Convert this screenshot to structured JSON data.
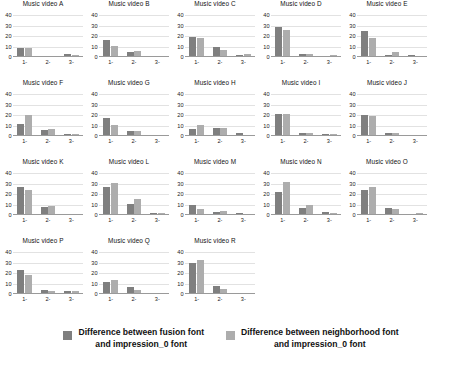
{
  "chart_data": {
    "type": "bar",
    "title": "",
    "xlabel": "",
    "ylabel": "",
    "ylim": [
      0,
      44
    ],
    "yticks": [
      0,
      10,
      20,
      30,
      40
    ],
    "ytick_labels": [
      "0",
      "10",
      "20",
      "30",
      "40"
    ],
    "categories": [
      "1-",
      "2-",
      "3-"
    ],
    "grid": true,
    "legend_position": "bottom",
    "series_names": [
      "Difference between fusion font and impression_0 font",
      "Difference between neighborhood font and impression_0 font"
    ],
    "colors": [
      "#7f7f7f",
      "#adadad"
    ],
    "panels": [
      {
        "title": "Music video A",
        "series": [
          {
            "name": "fusion",
            "values": [
              8,
              0,
              2
            ]
          },
          {
            "name": "neighborhood",
            "values": [
              8,
              0,
              1
            ]
          }
        ]
      },
      {
        "title": "Music video B",
        "series": [
          {
            "name": "fusion",
            "values": [
              15,
              4,
              0
            ]
          },
          {
            "name": "neighborhood",
            "values": [
              10,
              5,
              0
            ]
          }
        ]
      },
      {
        "title": "Music video C",
        "series": [
          {
            "name": "fusion",
            "values": [
              18,
              9,
              1
            ]
          },
          {
            "name": "neighborhood",
            "values": [
              17,
              6,
              2
            ]
          }
        ]
      },
      {
        "title": "Music video D",
        "series": [
          {
            "name": "fusion",
            "values": [
              28,
              2,
              0
            ]
          },
          {
            "name": "neighborhood",
            "values": [
              25,
              2,
              1
            ]
          }
        ]
      },
      {
        "title": "Music video E",
        "series": [
          {
            "name": "fusion",
            "values": [
              24,
              1,
              1
            ]
          },
          {
            "name": "neighborhood",
            "values": [
              17,
              4,
              0
            ]
          }
        ]
      },
      {
        "title": "Music video F",
        "series": [
          {
            "name": "fusion",
            "values": [
              11,
              5,
              1
            ]
          },
          {
            "name": "neighborhood",
            "values": [
              19,
              6,
              1
            ]
          }
        ]
      },
      {
        "title": "Music video G",
        "series": [
          {
            "name": "fusion",
            "values": [
              16,
              4,
              0
            ]
          },
          {
            "name": "neighborhood",
            "values": [
              10,
              4,
              0
            ]
          }
        ]
      },
      {
        "title": "Music video H",
        "series": [
          {
            "name": "fusion",
            "values": [
              6,
              7,
              2
            ]
          },
          {
            "name": "neighborhood",
            "values": [
              10,
              7,
              0
            ]
          }
        ]
      },
      {
        "title": "Music video I",
        "series": [
          {
            "name": "fusion",
            "values": [
              20,
              2,
              1
            ]
          },
          {
            "name": "neighborhood",
            "values": [
              20,
              2,
              1
            ]
          }
        ]
      },
      {
        "title": "Music video J",
        "series": [
          {
            "name": "fusion",
            "values": [
              19,
              2,
              0
            ]
          },
          {
            "name": "neighborhood",
            "values": [
              18,
              2,
              0
            ]
          }
        ]
      },
      {
        "title": "Music video K",
        "series": [
          {
            "name": "fusion",
            "values": [
              26,
              7,
              0
            ]
          },
          {
            "name": "neighborhood",
            "values": [
              23,
              8,
              0
            ]
          }
        ]
      },
      {
        "title": "Music video L",
        "series": [
          {
            "name": "fusion",
            "values": [
              26,
              10,
              1
            ]
          },
          {
            "name": "neighborhood",
            "values": [
              30,
              14,
              1
            ]
          }
        ]
      },
      {
        "title": "Music video M",
        "series": [
          {
            "name": "fusion",
            "values": [
              9,
              2,
              1
            ]
          },
          {
            "name": "neighborhood",
            "values": [
              5,
              3,
              0
            ]
          }
        ]
      },
      {
        "title": "Music video N",
        "series": [
          {
            "name": "fusion",
            "values": [
              21,
              6,
              2
            ]
          },
          {
            "name": "neighborhood",
            "values": [
              31,
              9,
              1
            ]
          }
        ]
      },
      {
        "title": "Music video O",
        "series": [
          {
            "name": "fusion",
            "values": [
              23,
              6,
              0
            ]
          },
          {
            "name": "neighborhood",
            "values": [
              26,
              5,
              1
            ]
          }
        ]
      },
      {
        "title": "Music video P",
        "series": [
          {
            "name": "fusion",
            "values": [
              22,
              3,
              2
            ]
          },
          {
            "name": "neighborhood",
            "values": [
              17,
              2,
              2
            ]
          }
        ]
      },
      {
        "title": "Music video Q",
        "series": [
          {
            "name": "fusion",
            "values": [
              11,
              6,
              0
            ]
          },
          {
            "name": "neighborhood",
            "values": [
              12,
              3,
              0
            ]
          }
        ]
      },
      {
        "title": "Music video R",
        "series": [
          {
            "name": "fusion",
            "values": [
              29,
              7,
              0
            ]
          },
          {
            "name": "neighborhood",
            "values": [
              32,
              4,
              0
            ]
          }
        ]
      }
    ]
  },
  "legend": {
    "items": [
      {
        "label": "Difference between fusion font\nand impression_0 font",
        "color": "#7f7f7f"
      },
      {
        "label": "Difference between neighborhood font\nand impression_0 font",
        "color": "#adadad"
      }
    ]
  }
}
